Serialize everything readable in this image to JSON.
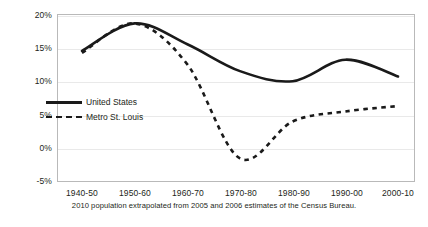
{
  "chart_data": {
    "type": "line",
    "title": "",
    "subtitle": "",
    "xlabel": "",
    "ylabel": "",
    "categories": [
      "1940-50",
      "1950-60",
      "1960-70",
      "1970-80",
      "1980-90",
      "1990-00",
      "2000-10"
    ],
    "series": [
      {
        "name": "United States",
        "style": "solid",
        "color": "#1a1a1a",
        "values": [
          14.5,
          18.6,
          15.5,
          11.5,
          10.0,
          13.2,
          10.7
        ]
      },
      {
        "name": "Metro St. Louis",
        "style": "dashed",
        "color": "#1a1a1a",
        "values": [
          14.2,
          18.6,
          12.5,
          -1.5,
          4.0,
          5.5,
          6.3
        ]
      }
    ],
    "ylim": [
      -5,
      20
    ],
    "yticks": [
      20,
      15,
      10,
      5,
      0,
      -5
    ],
    "ytick_labels": [
      "20%",
      "15%",
      "10%",
      "5%",
      "0%",
      "-5%"
    ],
    "grid": true,
    "grid_axis": "y",
    "legend_position": "inside-upper-left",
    "annotations": [
      "2010 population extrapolated from 2005 and 2006 estimates of the Census Bureau."
    ]
  },
  "axes": {
    "y_tick_labels": [
      "20%",
      "15%",
      "10%",
      "5%",
      "0%",
      "-5%"
    ],
    "x_tick_labels": [
      "1940-50",
      "1950-60",
      "1960-70",
      "1970-80",
      "1980-90",
      "1990-00",
      "2000-10"
    ]
  },
  "legend": {
    "items": [
      {
        "label": "United States",
        "style": "solid"
      },
      {
        "label": "Metro St. Louis",
        "style": "dashed"
      }
    ]
  },
  "footnote": {
    "text": "2010 population extrapolated from 2005 and 2006 estimates of the Census Bureau."
  },
  "colors": {
    "series": "#1a1a1a",
    "grid": "#e9e9e9",
    "frame": "#b9b9b9",
    "text": "#231f20",
    "background": "#ffffff"
  }
}
